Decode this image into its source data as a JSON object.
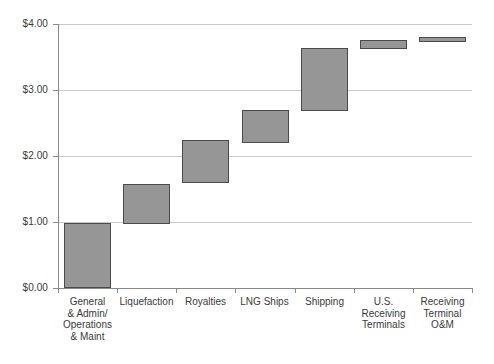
{
  "chart_data": {
    "type": "bar",
    "subtype": "waterfall",
    "title": "",
    "xlabel": "",
    "ylabel": "",
    "ylim": [
      0.0,
      4.0
    ],
    "ytick_values": [
      0.0,
      1.0,
      2.0,
      3.0,
      4.0
    ],
    "ytick_labels": [
      "$0.00",
      "$1.00",
      "$2.00",
      "$3.00",
      "$4.00"
    ],
    "grid": true,
    "legend": "none",
    "currency_prefix": "$",
    "categories": [
      "General\n& Admin/\nOperations\n& Maint",
      "Liquefaction",
      "Royalties",
      "LNG Ships",
      "Shipping",
      "U.S.\nReceiving\nTerminals",
      "Receiving\nTerminal\nO&M"
    ],
    "bars": [
      {
        "label": "General & Admin/ Operations & Maint",
        "bottom": 0.0,
        "top": 0.98,
        "delta": 0.98
      },
      {
        "label": "Liquefaction",
        "bottom": 0.97,
        "top": 1.58,
        "delta": 0.61
      },
      {
        "label": "Royalties",
        "bottom": 1.59,
        "top": 2.24,
        "delta": 0.65
      },
      {
        "label": "LNG Ships",
        "bottom": 2.2,
        "top": 2.7,
        "delta": 0.5
      },
      {
        "label": "Shipping",
        "bottom": 2.68,
        "top": 3.64,
        "delta": 0.96
      },
      {
        "label": "U.S. Receiving Terminals",
        "bottom": 3.62,
        "top": 3.76,
        "delta": 0.14
      },
      {
        "label": "Receiving Terminal O&M",
        "bottom": 3.73,
        "top": 3.8,
        "delta": 0.07
      }
    ],
    "bottoms": [
      0.0,
      0.97,
      1.59,
      2.2,
      2.68,
      3.62,
      3.73
    ],
    "tops": [
      0.98,
      1.58,
      2.24,
      2.7,
      3.64,
      3.76,
      3.8
    ],
    "values": [
      0.98,
      0.61,
      0.65,
      0.5,
      0.96,
      0.14,
      0.07
    ],
    "cumulative_total": 3.8,
    "colors": {
      "bar_fill": "#969696",
      "bar_border": "#4a4a4a",
      "gridline": "#c8c8c8",
      "axis": "#8a8a8a",
      "text": "#3a3a3a",
      "background": "#ffffff"
    }
  }
}
